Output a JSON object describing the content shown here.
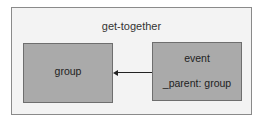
{
  "diagram": {
    "container": {
      "label": "get-together"
    },
    "nodes": [
      {
        "id": "group",
        "label": "group"
      },
      {
        "id": "event",
        "label": "event",
        "sublabel": "_parent: group"
      }
    ],
    "edges": [
      {
        "from": "event",
        "to": "group"
      }
    ],
    "colors": {
      "container_bg": "#f3f3f3",
      "node_bg": "#aaaaaa",
      "border": "#6e6e6e"
    }
  }
}
